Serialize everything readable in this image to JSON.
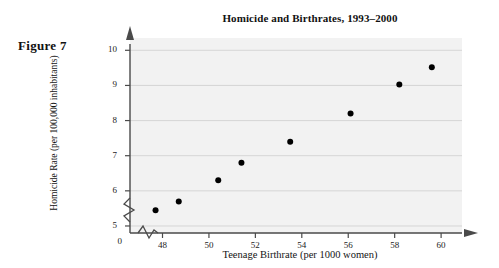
{
  "figure": {
    "label": "Figure 7"
  },
  "chart_data": {
    "type": "scatter",
    "title": "Homicide and Birthrates, 1993–2000",
    "xlabel": "Teenage Birthrate (per 1000 women)",
    "ylabel": "Homicide Rate (per 100,000 inhabitants)",
    "xlim": [
      46.6,
      60.9
    ],
    "ylim": [
      4.8,
      10.35
    ],
    "xticks": [
      48,
      50,
      52,
      54,
      56,
      58,
      60
    ],
    "xtick_labels": [
      "48",
      "50",
      "52",
      "54",
      "56",
      "58",
      "60"
    ],
    "yticks": [
      5,
      6,
      7,
      8,
      9,
      10
    ],
    "ytick_labels": [
      "5",
      "6",
      "7",
      "8",
      "9",
      "10"
    ],
    "origin_label": "0",
    "axis_break_x": true,
    "axis_break_y": true,
    "grid": true,
    "grid_axis": "y",
    "legend": "none",
    "marker": "filled-circle",
    "marker_color": "#000000",
    "plot_background": "#f2f2f2",
    "points": [
      {
        "x": 47.7,
        "y": 5.45
      },
      {
        "x": 48.7,
        "y": 5.7
      },
      {
        "x": 50.4,
        "y": 6.3
      },
      {
        "x": 51.4,
        "y": 6.8
      },
      {
        "x": 53.5,
        "y": 7.4
      },
      {
        "x": 56.1,
        "y": 8.2
      },
      {
        "x": 58.2,
        "y": 9.03
      },
      {
        "x": 59.6,
        "y": 9.52
      }
    ]
  }
}
